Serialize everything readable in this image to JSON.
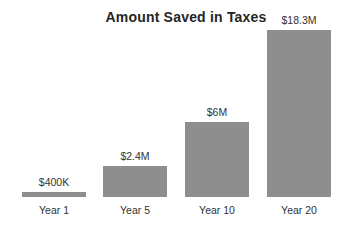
{
  "chart_data": {
    "type": "bar",
    "title": "Amount Saved in Taxes",
    "categories": [
      "Year 1",
      "Year 5",
      "Year 10",
      "Year 20"
    ],
    "values": [
      0.4,
      2.4,
      6,
      18.3
    ],
    "value_unit": "million USD",
    "value_labels": [
      "$400K",
      "$2.4M",
      "$6M",
      "$18.3M"
    ],
    "xlabel": "",
    "ylabel": "",
    "grid": false,
    "legend": "none",
    "axes_visible": false,
    "background": "#ffffff",
    "bar_color": "#8e8e8e",
    "title_color": "#262626",
    "label_color": "#333333",
    "bar_heights_px": [
      5,
      31,
      75,
      167
    ],
    "bar_width_px": 64,
    "baseline_y_px": 197
  }
}
